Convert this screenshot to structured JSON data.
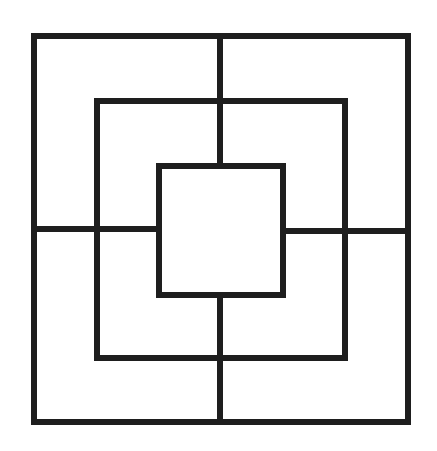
{
  "diagram": {
    "background": "#ffffff",
    "stroke_color": "#1e1e1e",
    "stroke_width": 6,
    "squares": [
      {
        "name": "outer",
        "x": 34,
        "y": 36,
        "w": 374,
        "h": 386
      },
      {
        "name": "middle",
        "x": 97,
        "y": 101,
        "w": 248,
        "h": 257
      },
      {
        "name": "inner",
        "x": 159,
        "y": 166,
        "w": 124,
        "h": 129
      }
    ],
    "connectors": [
      {
        "name": "top",
        "x1": 220,
        "y1": 36,
        "x2": 220,
        "y2": 166
      },
      {
        "name": "bottom",
        "x1": 220,
        "y1": 295,
        "x2": 220,
        "y2": 422
      },
      {
        "name": "left",
        "x1": 34,
        "y1": 229,
        "x2": 159,
        "y2": 229
      },
      {
        "name": "right",
        "x1": 283,
        "y1": 231,
        "x2": 408,
        "y2": 231
      }
    ]
  }
}
